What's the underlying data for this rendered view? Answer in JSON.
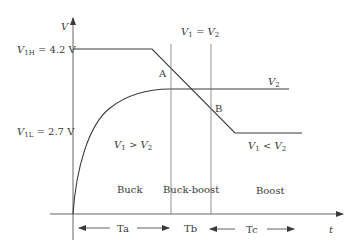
{
  "axes": {
    "y_label": "V",
    "x_label": "t"
  },
  "levels": {
    "v1h": {
      "name": "V",
      "sub": "1H",
      "value": " = 4.2 V"
    },
    "v1l": {
      "name": "V",
      "sub": "1L",
      "value": " = 2.7 V"
    }
  },
  "curves": {
    "v2_label": {
      "name": "V",
      "sub": "2"
    }
  },
  "points": {
    "a": "A",
    "b": "B"
  },
  "conditions": {
    "equal": {
      "lhs": "V",
      "lhs_sub": "1",
      "op": " = ",
      "rhs": "V",
      "rhs_sub": "2"
    },
    "greater": {
      "lhs": "V",
      "lhs_sub": "1",
      "op": " > ",
      "rhs": "V",
      "rhs_sub": "2"
    },
    "less": {
      "lhs": "V",
      "lhs_sub": "1",
      "op": " < ",
      "rhs": "V",
      "rhs_sub": "2"
    }
  },
  "modes": {
    "buck": "Buck",
    "buck_boost": "Buck-boost",
    "boost": "Boost"
  },
  "intervals": {
    "ta": "Ta",
    "tb": "Tb",
    "tc": "Tc"
  },
  "colors": {
    "line": "#3a3a3a",
    "thin": "#7a7a7a"
  }
}
